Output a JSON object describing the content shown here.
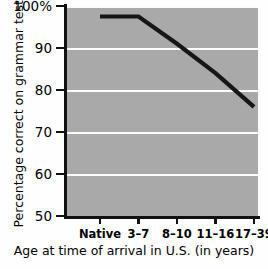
{
  "chart_data": {
    "type": "line",
    "title": "",
    "xlabel": "Age at time of arrival in U.S. (in years)",
    "ylabel": "Percentage correct on grammar test",
    "categories": [
      "Native",
      "3–7",
      "8–10",
      "11–16",
      "17–39"
    ],
    "values": [
      97.5,
      97.5,
      91,
      84,
      76
    ],
    "ylim": [
      50,
      100
    ],
    "yticks": [
      50,
      60,
      70,
      80,
      90,
      100
    ],
    "ytick_labels": [
      "50",
      "60",
      "70",
      "80",
      "90",
      "100%"
    ],
    "grid": "horizontal",
    "legend": "none",
    "markers": "none",
    "plot_background": "#a9a9a9",
    "gridline_color": "#fbfbfb",
    "line_color": "#161616"
  }
}
